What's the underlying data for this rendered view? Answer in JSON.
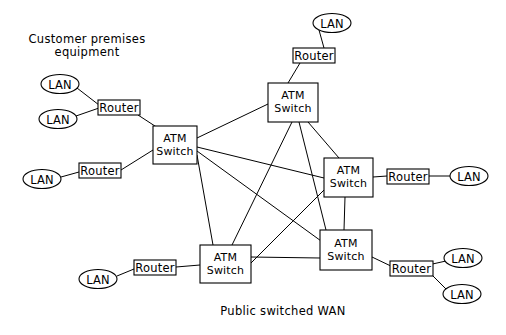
{
  "diagram": {
    "title_text_blocks": {
      "customer_premises": "Customer premises\nequipment",
      "public_wan": "Public switched WAN"
    },
    "colors": {
      "background": "#ffffff",
      "stroke": "#000000",
      "text": "#000000"
    },
    "labels": {
      "lan": "LAN",
      "router": "Router",
      "atm_switch_line1": "ATM",
      "atm_switch_line2": "Switch"
    },
    "nodes": [
      {
        "id": "lan-1",
        "type": "lan",
        "label": "LAN",
        "cx": 60,
        "cy": 84,
        "rx": 19,
        "ry": 9.5
      },
      {
        "id": "lan-2",
        "type": "lan",
        "label": "LAN",
        "cx": 58,
        "cy": 119,
        "rx": 19,
        "ry": 9.5
      },
      {
        "id": "lan-3",
        "type": "lan",
        "label": "LAN",
        "cx": 42,
        "cy": 179,
        "rx": 19,
        "ry": 9.5
      },
      {
        "id": "lan-4",
        "type": "lan",
        "label": "LAN",
        "cx": 332,
        "cy": 23,
        "rx": 19,
        "ry": 9.5
      },
      {
        "id": "lan-5",
        "type": "lan",
        "label": "LAN",
        "cx": 469,
        "cy": 176,
        "rx": 19,
        "ry": 9.5
      },
      {
        "id": "lan-6",
        "type": "lan",
        "label": "LAN",
        "cx": 463,
        "cy": 258,
        "rx": 19,
        "ry": 9.5
      },
      {
        "id": "lan-7",
        "type": "lan",
        "label": "LAN",
        "cx": 462,
        "cy": 294,
        "rx": 19,
        "ry": 9.5
      },
      {
        "id": "lan-8",
        "type": "lan",
        "label": "LAN",
        "cx": 98,
        "cy": 279,
        "rx": 19,
        "ry": 9.5
      },
      {
        "id": "router-1",
        "type": "router",
        "label": "Router",
        "x": 98,
        "y": 100,
        "w": 42,
        "h": 15
      },
      {
        "id": "router-2",
        "type": "router",
        "label": "Router",
        "x": 79,
        "y": 163,
        "w": 42,
        "h": 15
      },
      {
        "id": "router-3",
        "type": "router",
        "label": "Router",
        "x": 293,
        "y": 48,
        "w": 42,
        "h": 15
      },
      {
        "id": "router-4",
        "type": "router",
        "label": "Router",
        "x": 387,
        "y": 169,
        "w": 42,
        "h": 15
      },
      {
        "id": "router-5",
        "type": "router",
        "label": "Router",
        "x": 390,
        "y": 261,
        "w": 43,
        "h": 15
      },
      {
        "id": "router-6",
        "type": "router",
        "label": "Router",
        "x": 134,
        "y": 260,
        "w": 42,
        "h": 15
      },
      {
        "id": "switch-left",
        "type": "atm-switch",
        "label": "ATM Switch",
        "x": 153,
        "y": 126,
        "w": 44,
        "h": 38
      },
      {
        "id": "switch-top",
        "type": "atm-switch",
        "label": "ATM Switch",
        "x": 268,
        "y": 83,
        "w": 50,
        "h": 39
      },
      {
        "id": "switch-right-middle",
        "type": "atm-switch",
        "label": "ATM Switch",
        "x": 324,
        "y": 158,
        "w": 49,
        "h": 39
      },
      {
        "id": "switch-right-bottom",
        "type": "atm-switch",
        "label": "ATM Switch",
        "x": 320,
        "y": 230,
        "w": 52,
        "h": 40
      },
      {
        "id": "switch-bottom-left",
        "type": "atm-switch",
        "label": "ATM Switch",
        "x": 200,
        "y": 245,
        "w": 51,
        "h": 38
      }
    ],
    "edges": [
      {
        "from": "lan-1",
        "to": "router-1",
        "points": "77,88 99,105"
      },
      {
        "from": "lan-2",
        "to": "router-1",
        "points": "76,116 99,108"
      },
      {
        "from": "router-1",
        "to": "switch-left",
        "points": "138,115 158,128"
      },
      {
        "from": "lan-3",
        "to": "router-2",
        "points": "61,177 79,172"
      },
      {
        "from": "router-2",
        "to": "switch-left",
        "points": "121,170 153,149"
      },
      {
        "from": "lan-4",
        "to": "router-3",
        "points": "318,30 323,48"
      },
      {
        "from": "router-3",
        "to": "switch-top",
        "points": "300,63 288,83"
      },
      {
        "from": "switch-left",
        "to": "switch-top",
        "points": "197,138 268,104"
      },
      {
        "from": "switch-left",
        "to": "switch-right-middle",
        "points": "197,147 324,178"
      },
      {
        "from": "switch-left",
        "to": "switch-right-bottom",
        "points": "197,151 327,245"
      },
      {
        "from": "switch-left",
        "to": "switch-bottom-left",
        "points": "197,155 213,245"
      },
      {
        "from": "switch-top",
        "to": "switch-right-middle",
        "points": "307,122 338,158"
      },
      {
        "from": "switch-top",
        "to": "switch-right-bottom",
        "points": "299,122 325,230"
      },
      {
        "from": "switch-top",
        "to": "switch-bottom-left",
        "points": "292,122 232,245"
      },
      {
        "from": "switch-right-middle",
        "to": "switch-right-bottom",
        "points": "345,197 344,230"
      },
      {
        "from": "switch-right-middle",
        "to": "switch-bottom-left",
        "points": "324,190 251,262"
      },
      {
        "from": "switch-right-bottom",
        "to": "switch-bottom-left",
        "points": "320,258 251,257"
      },
      {
        "from": "switch-right-middle",
        "to": "router-4",
        "points": "373,177 387,176"
      },
      {
        "from": "router-4",
        "to": "lan-5",
        "points": "429,176 450,176"
      },
      {
        "from": "switch-right-bottom",
        "to": "router-5",
        "points": "372,257 394,268"
      },
      {
        "from": "router-5",
        "to": "lan-6",
        "points": "428,265 446,261"
      },
      {
        "from": "router-5",
        "to": "lan-7",
        "points": "429,272 446,289"
      },
      {
        "from": "lan-8",
        "to": "router-6",
        "points": "117,276 134,269"
      },
      {
        "from": "router-6",
        "to": "switch-bottom-left",
        "points": "176,267 200,265"
      }
    ]
  }
}
